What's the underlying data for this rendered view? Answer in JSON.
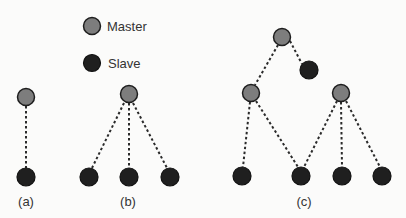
{
  "legend": {
    "master_label": "Master",
    "slave_label": "Slave",
    "master_color": "#7d7d7d",
    "slave_color": "#1f1f1f"
  },
  "subfigures": [
    {
      "label": "(a)",
      "description": "one master with one slave"
    },
    {
      "label": "(b)",
      "description": "one master with three slaves"
    },
    {
      "label": "(c)",
      "description": "hierarchical: master with one slave and two sub-masters; sub-masters share slaves"
    }
  ]
}
